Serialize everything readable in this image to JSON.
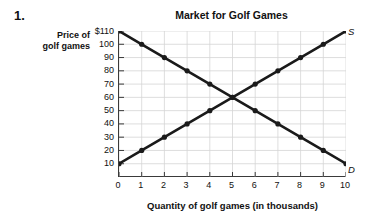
{
  "question": {
    "number": "1."
  },
  "labels": {
    "y_axis_line1": "Price of",
    "y_axis_line2": "golf games",
    "supply_curve": "S",
    "demand_curve": "D"
  },
  "chart_data": {
    "type": "line",
    "title": "Market for Golf Games",
    "xlabel": "Quantity of golf games (in thousands)",
    "ylabel": "Price of golf games",
    "grid": true,
    "legend_position": "inline-right-of-curve-ends",
    "xlim": [
      0,
      10
    ],
    "ylim": [
      0,
      110
    ],
    "x": [
      0,
      1,
      2,
      3,
      4,
      5,
      6,
      7,
      8,
      9,
      10
    ],
    "xticklabels": [
      "0",
      "1",
      "2",
      "3",
      "4",
      "5",
      "6",
      "7",
      "8",
      "9",
      "10"
    ],
    "yticks": [
      10,
      20,
      30,
      40,
      50,
      60,
      70,
      80,
      90,
      100,
      110
    ],
    "yticklabels": [
      "10",
      "20",
      "30",
      "40",
      "50",
      "60",
      "70",
      "80",
      "90",
      "100",
      "$110"
    ],
    "series": [
      {
        "name": "D",
        "label": "Demand",
        "color": "#1a1a1a",
        "marker": "circle",
        "values": [
          110,
          100,
          90,
          80,
          70,
          60,
          50,
          40,
          30,
          20,
          10
        ]
      },
      {
        "name": "S",
        "label": "Supply",
        "color": "#1a1a1a",
        "marker": "circle",
        "values": [
          10,
          20,
          30,
          40,
          50,
          60,
          70,
          80,
          90,
          100,
          110
        ]
      }
    ],
    "annotations": [
      {
        "text": "equilibrium",
        "x": 5,
        "y": 60,
        "visible": false
      }
    ]
  }
}
